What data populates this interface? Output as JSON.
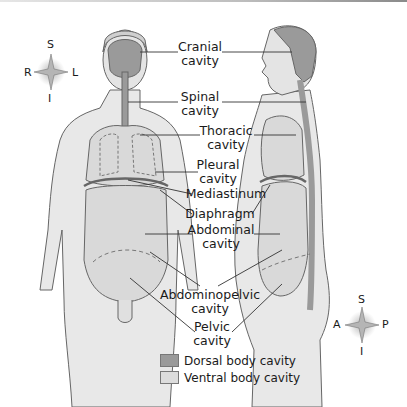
{
  "colors": {
    "dorsal": "#9a9a9a",
    "ventral": "#d9d9d9",
    "body": "#e6e6e6",
    "outline": "#555555"
  },
  "labels": {
    "cranial": [
      "Cranial",
      "cavity"
    ],
    "spinal": [
      "Spinal",
      "cavity"
    ],
    "thoracic": [
      "Thoracic",
      "cavity"
    ],
    "pleural": [
      "Pleural",
      "cavity"
    ],
    "mediastinum": "Mediastinum",
    "diaphragm": "Diaphragm",
    "abdominal": [
      "Abdominal",
      "cavity"
    ],
    "abdominopelvic": [
      "Abdominopelvic",
      "cavity"
    ],
    "pelvic": [
      "Pelvic",
      "cavity"
    ]
  },
  "compass_front": {
    "top": "S",
    "bottom": "I",
    "left": "R",
    "right": "L"
  },
  "compass_side": {
    "top": "S",
    "bottom": "I",
    "left": "A",
    "right": "P"
  },
  "legend": [
    {
      "label": "Dorsal body cavity",
      "color": "#9a9a9a"
    },
    {
      "label": "Ventral body cavity",
      "color": "#dcdcdc"
    }
  ]
}
